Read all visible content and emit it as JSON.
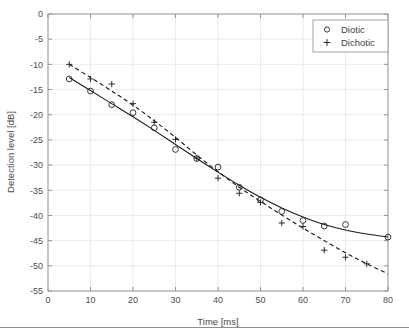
{
  "chart_data": {
    "type": "scatter",
    "title": "",
    "xlabel": "Time [ms]",
    "ylabel": "Detection level [dB]",
    "xlim": [
      0,
      80
    ],
    "ylim": [
      -55,
      0
    ],
    "xticks": [
      0,
      10,
      20,
      30,
      40,
      50,
      60,
      70,
      80
    ],
    "yticks": [
      0,
      -5,
      -10,
      -15,
      -20,
      -25,
      -30,
      -35,
      -40,
      -45,
      -50,
      -55
    ],
    "xtick_labels": [
      "0",
      "10",
      "20",
      "30",
      "40",
      "50",
      "60",
      "70",
      "80"
    ],
    "ytick_labels": [
      "0",
      "-5",
      "-10",
      "-15",
      "-20",
      "-25",
      "-30",
      "-35",
      "-40",
      "-45",
      "-50",
      "-55"
    ],
    "grid": true,
    "legend_position": "top-right",
    "series": [
      {
        "name": "Diotic",
        "marker": "circle",
        "line_style": "solid",
        "x": [
          5,
          10,
          15,
          20,
          25,
          30,
          35,
          40,
          45,
          50,
          55,
          60,
          65,
          70,
          80
        ],
        "values": [
          -12.9,
          -15.3,
          -18.0,
          -19.6,
          -22.6,
          -26.9,
          -28.7,
          -30.4,
          -34.4,
          -36.9,
          -39.2,
          -41.0,
          -42.1,
          -41.8,
          -44.3
        ],
        "fit_x": [
          5,
          10,
          15,
          20,
          25,
          30,
          35,
          40,
          45,
          50,
          55,
          60,
          65,
          70,
          75,
          80
        ],
        "fit_y": [
          -12.6,
          -15.2,
          -17.8,
          -20.4,
          -23.1,
          -25.9,
          -28.7,
          -31.4,
          -34.0,
          -36.4,
          -38.5,
          -40.3,
          -41.8,
          -42.9,
          -43.7,
          -44.3
        ]
      },
      {
        "name": "Dichotic",
        "marker": "plus",
        "line_style": "dashed",
        "x": [
          5,
          10,
          15,
          20,
          25,
          30,
          35,
          40,
          45,
          50,
          55,
          60,
          65,
          70,
          75
        ],
        "values": [
          -10.0,
          -12.9,
          -13.9,
          -17.8,
          -21.5,
          -24.9,
          -28.6,
          -32.6,
          -35.6,
          -37.4,
          -41.5,
          -42.2,
          -46.9,
          -48.3,
          -49.6
        ],
        "fit_x": [
          5,
          10,
          15,
          20,
          25,
          30,
          35,
          40,
          45,
          50,
          55,
          60,
          65,
          70,
          75,
          80
        ],
        "fit_y": [
          -10.0,
          -12.6,
          -15.3,
          -18.1,
          -21.2,
          -24.5,
          -28.0,
          -31.3,
          -34.4,
          -37.2,
          -39.9,
          -42.5,
          -45.0,
          -47.4,
          -49.6,
          -51.6
        ]
      }
    ]
  },
  "legend": {
    "entries": [
      {
        "label": "Diotic",
        "marker": "circle-marker-icon"
      },
      {
        "label": "Dichotic",
        "marker": "plus-marker-icon"
      }
    ]
  },
  "axes": {
    "x_title": "Time [ms]",
    "y_title": "Detection level [dB]"
  }
}
